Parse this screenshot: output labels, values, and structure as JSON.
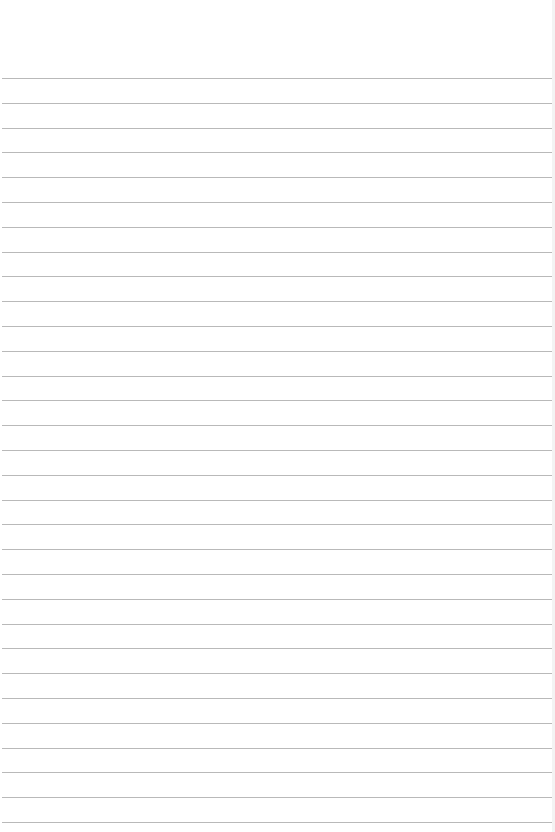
{
  "sheet": {
    "type": "ruled paper",
    "width": 555,
    "height": 832,
    "background_color": "#ffffff",
    "rule_color": "#b9b9b9",
    "rules": {
      "count": 31,
      "first_y": 78,
      "spacing": 24.8
    }
  }
}
